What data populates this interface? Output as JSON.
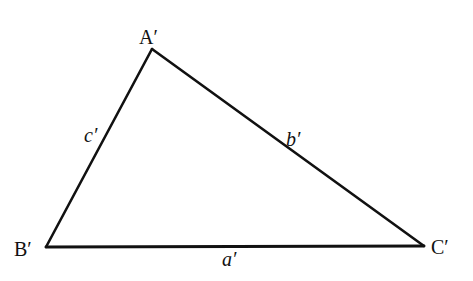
{
  "diagram": {
    "type": "triangle",
    "stroke_color": "#111111",
    "background_color": "#ffffff",
    "vertices": [
      {
        "id": "A",
        "label": "A′",
        "x": 152,
        "y": 49
      },
      {
        "id": "B",
        "label": "B′",
        "x": 46,
        "y": 247
      },
      {
        "id": "C",
        "label": "C′",
        "x": 424,
        "y": 246
      }
    ],
    "sides": [
      {
        "id": "a",
        "label": "a′",
        "from": "B",
        "to": "C"
      },
      {
        "id": "b",
        "label": "b′",
        "from": "A",
        "to": "C"
      },
      {
        "id": "c",
        "label": "c′",
        "from": "A",
        "to": "B"
      }
    ]
  }
}
